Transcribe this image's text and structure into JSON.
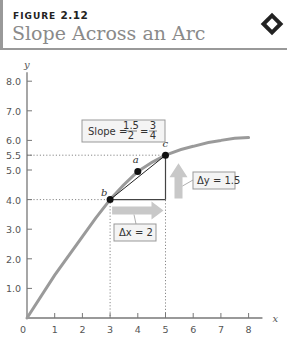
{
  "header": {
    "figure_word": "FIGURE",
    "figure_number": "2.12",
    "title": "Slope Across an Arc"
  },
  "chart_data": {
    "type": "line",
    "title": "Slope Across an Arc",
    "xlabel": "x",
    "ylabel": "y",
    "xlim": [
      0,
      8.5
    ],
    "ylim": [
      0,
      8.3
    ],
    "x_ticks": [
      "0",
      "1",
      "2",
      "3",
      "4",
      "5",
      "6",
      "7",
      "8"
    ],
    "y_ticks": [
      "1.0",
      "2.0",
      "3.0",
      "4.0",
      "5.0",
      "5.5",
      "6.0",
      "7.0",
      "8.0"
    ],
    "y_tick_values": [
      1,
      2,
      3,
      4,
      5,
      5.5,
      6,
      7,
      8
    ],
    "curve": {
      "x": [
        0,
        1,
        2,
        3,
        4,
        5,
        6,
        7,
        8
      ],
      "y": [
        0,
        1.45,
        2.75,
        4.0,
        4.95,
        5.5,
        5.8,
        6.0,
        6.1
      ]
    },
    "points": [
      {
        "label": "a",
        "x": 4,
        "y": 4.95
      },
      {
        "label": "b",
        "x": 3,
        "y": 4.0
      },
      {
        "label": "c",
        "x": 5,
        "y": 5.5
      }
    ],
    "guides": [
      {
        "type": "horizontal-dotted",
        "y": 5.5,
        "x_to": 5
      },
      {
        "type": "horizontal-dotted",
        "y": 4.0,
        "x_to": 3
      },
      {
        "type": "vertical-dotted",
        "x": 3,
        "y_to": 4.0
      },
      {
        "type": "vertical-dotted",
        "x": 5,
        "y_to": 5.5
      }
    ],
    "annotations": {
      "slope_prefix": "Slope =",
      "slope_num1": "1.5",
      "slope_den1": "2",
      "slope_num2": "3",
      "slope_den2": "4",
      "equals": "=",
      "delta_y": "Δy = 1.5",
      "delta_x": "Δx = 2"
    },
    "grid": false
  }
}
